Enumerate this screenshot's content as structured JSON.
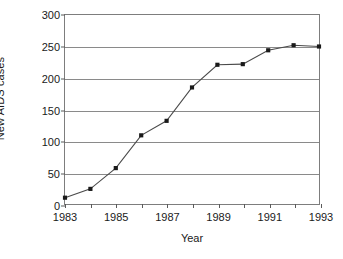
{
  "chart_data": {
    "type": "line",
    "title": "",
    "xlabel": "Year",
    "ylabel": "New AIDS cases",
    "x": [
      1983,
      1984,
      1985,
      1986,
      1987,
      1988,
      1989,
      1990,
      1991,
      1992,
      1993
    ],
    "values": [
      10,
      24,
      57,
      109,
      132,
      185,
      221,
      222,
      244,
      252,
      250
    ],
    "series": [
      {
        "name": "New AIDS cases",
        "values": [
          10,
          24,
          57,
          109,
          132,
          185,
          221,
          222,
          244,
          252,
          250
        ]
      }
    ],
    "xlim": [
      1983,
      1993
    ],
    "ylim": [
      0,
      300
    ],
    "ytick_values": [
      0,
      50,
      100,
      150,
      200,
      250,
      300
    ],
    "ytick_labels": [
      "0",
      "50",
      "100",
      "150",
      "200",
      "250",
      "300"
    ],
    "xtick_values": [
      1983,
      1984,
      1985,
      1986,
      1987,
      1988,
      1989,
      1990,
      1991,
      1992,
      1993
    ],
    "xtick_labels": [
      "1983",
      "",
      "1985",
      "",
      "1987",
      "",
      "1989",
      "",
      "1991",
      "",
      "1993"
    ],
    "grid": "horizontal",
    "legend": "none",
    "line_color": "#4a4a4a",
    "marker_color": "#1a1a1a",
    "marker_shape": "square",
    "axis_color": "#7d7d7d",
    "grid_color": "#8a8a8a",
    "background_color": "#ffffff"
  }
}
